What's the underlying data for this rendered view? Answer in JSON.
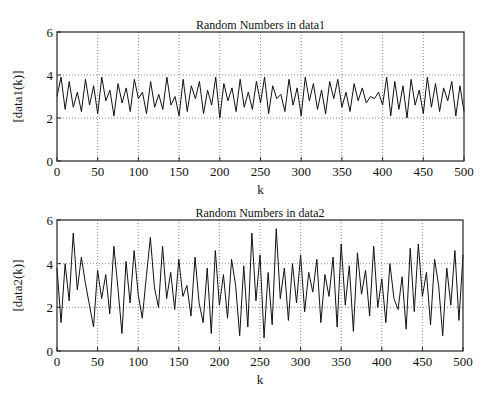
{
  "chart_data": [
    {
      "type": "line",
      "title": "Random Numbers in data1",
      "xlabel": "k",
      "ylabel": "[data1(k)]",
      "xlim": [
        0,
        500
      ],
      "ylim": [
        0,
        6
      ],
      "xticks": [
        0,
        50,
        100,
        150,
        200,
        250,
        300,
        350,
        400,
        450,
        500
      ],
      "yticks": [
        0,
        2,
        4,
        6
      ],
      "grid": true,
      "x_step": 5,
      "values": [
        3.0,
        3.9,
        2.4,
        3.7,
        2.5,
        3.2,
        2.3,
        3.8,
        2.6,
        3.5,
        2.2,
        3.9,
        2.8,
        3.3,
        2.1,
        3.6,
        2.7,
        3.4,
        2.3,
        3.8,
        2.9,
        3.2,
        2.2,
        3.7,
        2.5,
        3.1,
        2.4,
        3.9,
        2.6,
        3.0,
        2.1,
        3.8,
        2.3,
        3.5,
        2.9,
        3.7,
        2.2,
        3.3,
        2.6,
        3.9,
        2.0,
        3.6,
        2.8,
        3.4,
        2.3,
        3.8,
        2.5,
        3.2,
        2.4,
        3.7,
        2.7,
        3.9,
        2.2,
        3.5,
        2.9,
        3.1,
        2.3,
        3.8,
        2.6,
        3.4,
        2.1,
        3.9,
        2.8,
        3.6,
        2.4,
        3.3,
        2.2,
        3.7,
        2.9,
        3.8,
        2.5,
        3.2,
        2.3,
        3.6,
        2.8,
        3.4,
        2.7,
        3.0,
        2.9,
        3.2,
        2.6,
        3.9,
        2.1,
        3.7,
        2.4,
        3.5,
        2.0,
        3.8,
        2.6,
        3.3,
        2.2,
        3.9,
        2.5,
        3.6,
        2.3,
        3.4,
        2.8,
        3.7,
        2.1,
        3.5,
        2.3
      ]
    },
    {
      "type": "line",
      "title": "Random Numbers in data2",
      "xlabel": "k",
      "ylabel": "[data2(k)]",
      "xlim": [
        0,
        500
      ],
      "ylim": [
        0,
        6
      ],
      "xticks": [
        0,
        50,
        100,
        150,
        200,
        250,
        300,
        350,
        400,
        450,
        500
      ],
      "yticks": [
        0,
        2,
        4,
        6
      ],
      "grid": true,
      "x_step": 5,
      "values": [
        3.8,
        1.3,
        4.0,
        2.3,
        5.4,
        2.8,
        4.3,
        3.1,
        2.1,
        1.1,
        3.7,
        2.4,
        3.5,
        1.7,
        4.8,
        2.9,
        0.8,
        4.1,
        2.2,
        4.6,
        2.6,
        1.5,
        3.4,
        5.2,
        2.9,
        2.0,
        4.8,
        2.4,
        3.6,
        1.9,
        4.2,
        2.5,
        3.0,
        1.6,
        4.3,
        2.2,
        1.3,
        3.8,
        0.8,
        4.6,
        2.1,
        3.5,
        1.5,
        4.2,
        3.0,
        0.7,
        3.9,
        1.1,
        5.4,
        2.3,
        4.4,
        0.6,
        3.6,
        1.2,
        5.6,
        2.4,
        3.8,
        1.4,
        4.0,
        2.2,
        4.4,
        1.8,
        3.6,
        2.7,
        4.2,
        1.3,
        3.5,
        2.5,
        4.3,
        1.1,
        4.9,
        2.1,
        3.9,
        0.9,
        4.5,
        2.6,
        3.7,
        1.6,
        4.8,
        2.0,
        3.3,
        1.3,
        4.0,
        2.4,
        1.9,
        3.4,
        1.0,
        4.7,
        1.8,
        4.9,
        2.5,
        3.6,
        1.2,
        4.2,
        3.0,
        0.7,
        3.8,
        2.1,
        4.6,
        1.4,
        4.4
      ]
    }
  ]
}
